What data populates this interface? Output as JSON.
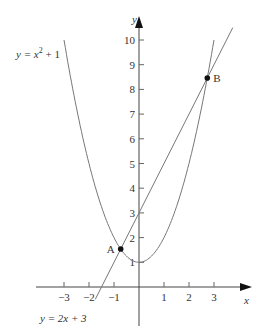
{
  "figure": {
    "type": "function-graph",
    "x_axis": {
      "label": "x",
      "ticks": [
        "−3",
        "−2",
        "−1",
        "1",
        "2",
        "3"
      ],
      "tick_values": [
        -3,
        -2,
        -1,
        1,
        2,
        3
      ]
    },
    "y_axis": {
      "label": "y",
      "ticks": [
        "1",
        "2",
        "3",
        "4",
        "5",
        "6",
        "7",
        "8",
        "9",
        "10"
      ],
      "tick_values": [
        1,
        2,
        3,
        4,
        5,
        6,
        7,
        8,
        9,
        10
      ]
    },
    "curves": [
      {
        "name": "parabola",
        "equation_label": "y = x² + 1",
        "lhs": "y = x",
        "exp": "2",
        "rhs": " + 1"
      },
      {
        "name": "line",
        "equation_label": "y = 2x + 3"
      }
    ],
    "points": [
      {
        "name": "A",
        "label": "A",
        "x": -0.732,
        "y": 1.536
      },
      {
        "name": "B",
        "label": "B",
        "x": 2.732,
        "y": 8.464
      }
    ],
    "colors": {
      "axis": "#444444",
      "curve": "#777777",
      "point": "#111111",
      "text": "#333333"
    }
  }
}
